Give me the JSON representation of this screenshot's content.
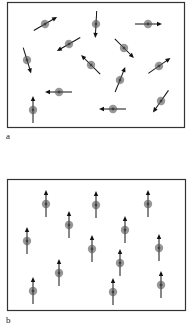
{
  "panels": [
    {
      "id": "a",
      "label": "a",
      "description": "randomly oriented spins",
      "frame": {
        "x": 7,
        "y": 2,
        "w": 177,
        "h": 125
      },
      "label_pos": {
        "x": 6,
        "y": 131
      },
      "spins": [
        {
          "x": 45,
          "y": 24,
          "angle": 60
        },
        {
          "x": 96,
          "y": 24,
          "angle": 183
        },
        {
          "x": 148,
          "y": 24,
          "angle": 90
        },
        {
          "x": 69,
          "y": 44,
          "angle": 240
        },
        {
          "x": 124,
          "y": 48,
          "angle": 135
        },
        {
          "x": 27,
          "y": 60,
          "angle": 163
        },
        {
          "x": 91,
          "y": 65,
          "angle": 315
        },
        {
          "x": 159,
          "y": 66,
          "angle": 55
        },
        {
          "x": 120,
          "y": 80,
          "angle": 22
        },
        {
          "x": 59,
          "y": 92,
          "angle": 270
        },
        {
          "x": 161,
          "y": 101,
          "angle": 215
        },
        {
          "x": 33,
          "y": 110,
          "angle": 0
        },
        {
          "x": 113,
          "y": 109,
          "angle": 270
        }
      ]
    },
    {
      "id": "b",
      "label": "b",
      "description": "aligned spins",
      "frame": {
        "x": 7,
        "y": 179,
        "w": 178,
        "h": 131
      },
      "label_pos": {
        "x": 6,
        "y": 315
      },
      "spins": [
        {
          "x": 46,
          "y": 204,
          "angle": 0
        },
        {
          "x": 96,
          "y": 205,
          "angle": 0
        },
        {
          "x": 148,
          "y": 204,
          "angle": 0
        },
        {
          "x": 69,
          "y": 225,
          "angle": 0
        },
        {
          "x": 125,
          "y": 230,
          "angle": 0
        },
        {
          "x": 27,
          "y": 241,
          "angle": 0
        },
        {
          "x": 92,
          "y": 249,
          "angle": 0
        },
        {
          "x": 159,
          "y": 248,
          "angle": 0
        },
        {
          "x": 120,
          "y": 263,
          "angle": 0
        },
        {
          "x": 59,
          "y": 273,
          "angle": 0
        },
        {
          "x": 161,
          "y": 285,
          "angle": 0
        },
        {
          "x": 33,
          "y": 291,
          "angle": 0
        },
        {
          "x": 113,
          "y": 292,
          "angle": 0
        }
      ]
    }
  ],
  "style": {
    "frame_color": "#333333",
    "arrow_color": "#111111",
    "spin_fill": "#8c8c8c",
    "spin_core": "#4a4a4a",
    "arrow_length": 26,
    "spin_radius": 4.2
  }
}
